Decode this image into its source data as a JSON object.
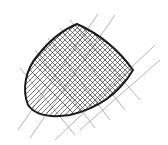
{
  "drawing": {
    "subject": "cross-hatched bullet shape sketch",
    "stroke_color": "#1a1a1a",
    "grid_color": "#9a9a9a",
    "hatch_color": "#3a3a3a",
    "background": "#ffffff"
  }
}
